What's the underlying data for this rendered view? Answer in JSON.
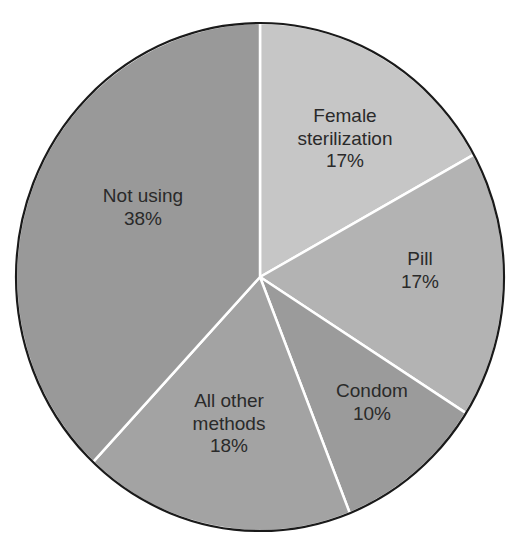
{
  "chart_data": {
    "type": "pie",
    "title": "",
    "start_angle_deg": 0,
    "direction": "clockwise",
    "slices": [
      {
        "label": "Female sterilization",
        "label_lines": [
          "Female",
          "sterilization"
        ],
        "value": 17,
        "value_text": "17%",
        "color": "#c6c6c6",
        "label_pos": [
          345,
          122
        ]
      },
      {
        "label": "Pill",
        "label_lines": [
          "Pill"
        ],
        "value": 17,
        "value_text": "17%",
        "color": "#b3b3b3",
        "label_pos": [
          420,
          265
        ]
      },
      {
        "label": "Condom",
        "label_lines": [
          "Condom"
        ],
        "value": 10,
        "value_text": "10%",
        "color": "#9b9b9b",
        "label_pos": [
          372,
          397
        ]
      },
      {
        "label": "All other methods",
        "label_lines": [
          "All other",
          "methods"
        ],
        "value": 18,
        "value_text": "18%",
        "color": "#a3a3a3",
        "label_pos": [
          229,
          407
        ]
      },
      {
        "label": "Not using",
        "label_lines": [
          "Not using"
        ],
        "value": 38,
        "value_text": "38%",
        "color": "#999999",
        "label_pos": [
          143,
          202
        ]
      }
    ],
    "categories": [
      "Female sterilization",
      "Pill",
      "Condom",
      "All other methods",
      "Not using"
    ],
    "values": [
      17,
      17,
      10,
      18,
      38
    ],
    "legend": "none (labels inside slices)"
  },
  "geometry": {
    "cx": 260,
    "cy": 277,
    "rx": 244,
    "ry": 254
  }
}
